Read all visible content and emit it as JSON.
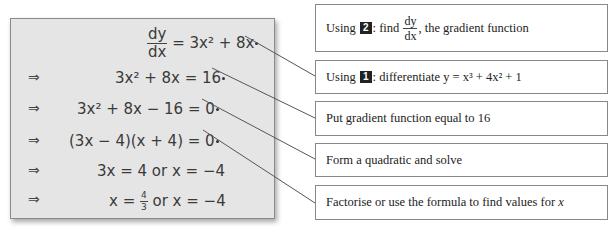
{
  "working": {
    "rows": [
      {
        "arrow": "",
        "lhs_num": "dy",
        "lhs_den": "dx",
        "rhs": " = 3x² + 8x"
      },
      {
        "arrow": "⇒",
        "text": "3x² + 8x = 16"
      },
      {
        "arrow": "⇒",
        "text": "3x² + 8x − 16 = 0"
      },
      {
        "arrow": "⇒",
        "text": "(3x − 4)(x + 4) = 0"
      },
      {
        "arrow": "⇒",
        "text": "3x = 4 or x = −4"
      },
      {
        "arrow": "⇒",
        "pre": "x = ",
        "frac_num": "4",
        "frac_den": "3",
        "post": " or x = −4"
      }
    ]
  },
  "notes": [
    {
      "prefix": "Using ",
      "badge": "2",
      "mid": ": find ",
      "frac_num": "dy",
      "frac_den": "dx",
      "suffix": ", the gradient function"
    },
    {
      "prefix": "Using ",
      "badge": "1",
      "mid": ": differentiate y = x³ + 4x² + 1"
    },
    {
      "text": "Put gradient function equal to 16"
    },
    {
      "text": "Form a quadratic and solve"
    },
    {
      "text": "Factorise or use the formula to find values for ",
      "var": "x"
    }
  ],
  "colors": {
    "box_bg": "#e5e5e5",
    "line": "#555555"
  }
}
